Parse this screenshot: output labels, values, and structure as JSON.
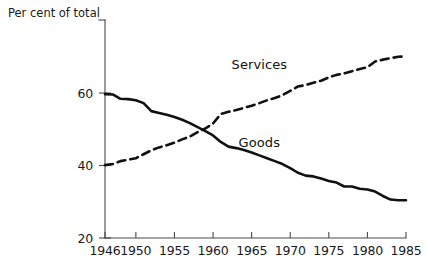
{
  "chart_data": {
    "type": "line",
    "title": "",
    "subtitle": "",
    "ylabel": "Per cent of total",
    "xlabel": "",
    "grid": false,
    "legend_position": "inline-annotation",
    "xlim": [
      1946,
      1985
    ],
    "ylim": [
      20,
      72
    ],
    "yticks": [
      20,
      40,
      60
    ],
    "ytick_labels": [
      "20",
      "40",
      "60"
    ],
    "xticks": [
      1946,
      1950,
      1955,
      1960,
      1965,
      1970,
      1975,
      1980,
      1985
    ],
    "xtick_labels": [
      "1946",
      "1950",
      "1955",
      "1960",
      "1965",
      "1970",
      "1975",
      "1980",
      "1985"
    ],
    "x": [
      1946,
      1947,
      1948,
      1949,
      1950,
      1951,
      1952,
      1953,
      1954,
      1955,
      1956,
      1957,
      1958,
      1959,
      1960,
      1961,
      1962,
      1963,
      1964,
      1965,
      1966,
      1967,
      1968,
      1969,
      1970,
      1971,
      1972,
      1973,
      1974,
      1975,
      1976,
      1977,
      1978,
      1979,
      1980,
      1981,
      1982,
      1983,
      1984,
      1985
    ],
    "series": [
      {
        "name": "Goods",
        "style": "solid",
        "color": "#111111",
        "annotation": "Goods",
        "values": [
          59.7,
          59.6,
          58.4,
          58.3,
          58.0,
          57.2,
          55.0,
          54.5,
          54.0,
          53.4,
          52.6,
          51.7,
          50.6,
          49.5,
          48.3,
          46.5,
          45.2,
          44.8,
          44.3,
          43.6,
          42.8,
          42.0,
          41.2,
          40.4,
          39.3,
          38.0,
          37.2,
          37.0,
          36.4,
          35.7,
          35.3,
          34.2,
          34.2,
          33.6,
          33.4,
          32.8,
          31.6,
          30.6,
          30.4,
          30.4
        ]
      },
      {
        "name": "Services",
        "style": "dashed",
        "color": "#111111",
        "annotation": "Services",
        "values": [
          40.1,
          40.4,
          41.2,
          41.6,
          42.0,
          43.1,
          44.2,
          45.0,
          45.6,
          46.3,
          47.2,
          48.0,
          49.2,
          50.2,
          51.6,
          54.2,
          54.8,
          55.3,
          55.9,
          56.5,
          57.2,
          58.0,
          58.6,
          59.4,
          60.6,
          61.8,
          62.2,
          62.8,
          63.4,
          64.3,
          65.0,
          65.4,
          66.0,
          66.6,
          67.1,
          68.7,
          69.2,
          69.6,
          70.0,
          70.1
        ]
      }
    ],
    "annotations": [
      {
        "text": "Services",
        "x": 1966,
        "y": 66.5
      },
      {
        "text": "Goods",
        "x": 1966,
        "y": 45.0
      }
    ]
  },
  "axes": {
    "y_axis_caption": "Per cent of total"
  }
}
